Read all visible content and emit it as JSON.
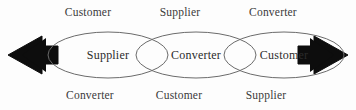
{
  "diagram": {
    "background_color": "#fdfdfd",
    "line_color": "#6b6b6b",
    "arrow_color": "#0d0d0d",
    "text_color": "#3a3a3a",
    "nodes": [
      {
        "id": "node-1",
        "label": "Supplier",
        "cx": 108,
        "cy": 55,
        "rx": 60,
        "ry": 23
      },
      {
        "id": "node-2",
        "label": "Converter",
        "cx": 196,
        "cy": 55,
        "rx": 60,
        "ry": 23
      },
      {
        "id": "node-3",
        "label": "Customer",
        "cx": 284,
        "cy": 55,
        "rx": 60,
        "ry": 23
      }
    ],
    "top_labels": [
      {
        "id": "top-1",
        "label": "Customer",
        "cx": 88
      },
      {
        "id": "top-2",
        "label": "Supplier",
        "cx": 180
      },
      {
        "id": "top-3",
        "label": "Converter",
        "cx": 273
      }
    ],
    "bottom_labels": [
      {
        "id": "bottom-1",
        "label": "Converter",
        "cx": 90
      },
      {
        "id": "bottom-2",
        "label": "Customer",
        "cx": 179
      },
      {
        "id": "bottom-3",
        "label": "Supplier",
        "cx": 266
      }
    ],
    "arrows": [
      {
        "id": "arrow-left",
        "direction": "left",
        "tip_x": 8,
        "y": 55
      },
      {
        "id": "arrow-right",
        "direction": "right",
        "tip_x": 348,
        "y": 55
      }
    ]
  }
}
